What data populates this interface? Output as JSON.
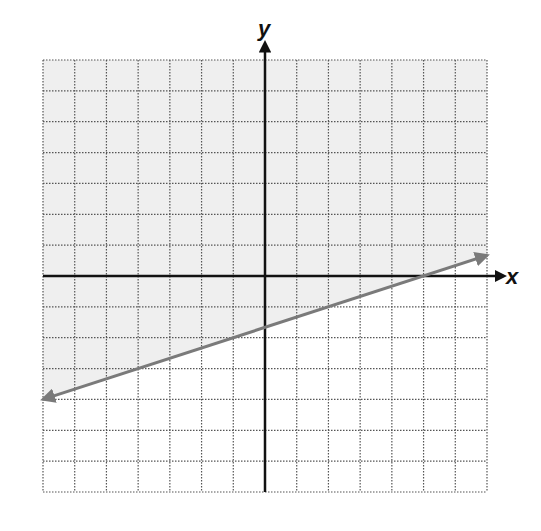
{
  "chart_data": {
    "type": "line",
    "title": "",
    "xlabel": "x",
    "ylabel": "y",
    "xlim": [
      -7,
      7
    ],
    "ylim": [
      -7,
      7
    ],
    "grid": true,
    "grid_step": 1,
    "tick_labels": false,
    "series": [
      {
        "name": "boundary line",
        "equation": "y = (1/3)x - 5/3",
        "points": [
          [
            -7,
            -4
          ],
          [
            7,
            0.67
          ]
        ],
        "style": "solid",
        "arrows": "both",
        "color": "#7a7a7a"
      }
    ],
    "shaded_region": {
      "description": "half-plane above the line",
      "inequality": "y > (1/3)x - 5/3",
      "color": "#f0f0f0"
    }
  },
  "labels": {
    "x_axis": "x",
    "y_axis": "y"
  },
  "colors": {
    "axis": "#111111",
    "grid": "#555555",
    "line": "#7a7a7a",
    "shade": "#efefef"
  }
}
